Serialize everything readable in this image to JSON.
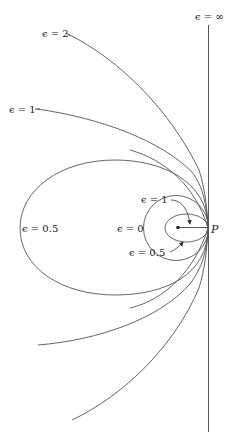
{
  "diagram": {
    "point_label": "P",
    "labels": {
      "inf": "ϵ = ∞",
      "two": "ϵ = 2",
      "one_outer": "ϵ = 1",
      "half_outer": "ϵ = 0.5",
      "one_inner": "ϵ = 1",
      "zero": "ϵ = 0",
      "half_inner": "ϵ = 0.5"
    },
    "curves": [
      {
        "eccentricity": "∞",
        "type": "line"
      },
      {
        "eccentricity": "2",
        "type": "hyperbola"
      },
      {
        "eccentricity": "1",
        "type": "parabola"
      },
      {
        "eccentricity": "0.5",
        "type": "ellipse"
      },
      {
        "eccentricity": "1",
        "type": "degenerate-segment"
      },
      {
        "eccentricity": "0",
        "type": "circle"
      },
      {
        "eccentricity": "0.5",
        "type": "ellipse"
      }
    ],
    "colors": {
      "stroke": "#555555",
      "text": "#222222",
      "background": "#ffffff"
    }
  }
}
